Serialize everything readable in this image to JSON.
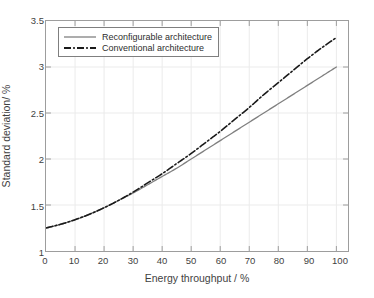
{
  "chart_data": {
    "type": "line",
    "title": "",
    "xlabel": "Energy throughput / %",
    "ylabel": "Standard deviation/ %",
    "xlim": [
      0,
      104
    ],
    "ylim": [
      1,
      3.5
    ],
    "xticks": [
      "0",
      "10",
      "20",
      "30",
      "40",
      "50",
      "60",
      "70",
      "80",
      "90",
      "100"
    ],
    "yticks": [
      "1",
      "1.5",
      "2",
      "2.5",
      "3",
      "3.5"
    ],
    "grid": true,
    "legend_position": "upper left",
    "x": [
      0,
      5,
      10,
      15,
      20,
      25,
      30,
      35,
      40,
      45,
      50,
      55,
      60,
      65,
      70,
      75,
      80,
      85,
      90,
      95,
      100
    ],
    "series": [
      {
        "name": "Reconfigurable architecture",
        "style": "solid",
        "color": "#808080",
        "values": [
          1.25,
          1.29,
          1.34,
          1.4,
          1.47,
          1.55,
          1.63,
          1.72,
          1.81,
          1.9,
          2.0,
          2.1,
          2.2,
          2.3,
          2.4,
          2.5,
          2.6,
          2.7,
          2.8,
          2.9,
          3.0
        ]
      },
      {
        "name": "Conventional architecture",
        "style": "dash-dot",
        "color": "#1a1a1a",
        "values": [
          1.25,
          1.29,
          1.34,
          1.4,
          1.47,
          1.55,
          1.64,
          1.74,
          1.84,
          1.95,
          2.06,
          2.18,
          2.3,
          2.43,
          2.56,
          2.7,
          2.83,
          2.96,
          3.09,
          3.21,
          3.32
        ]
      }
    ]
  },
  "legend": {
    "items": [
      {
        "label": "Reconfigurable architecture",
        "swatch": "solid-gray-line-icon"
      },
      {
        "label": "Conventional architecture",
        "swatch": "dash-dot-black-line-icon"
      }
    ]
  },
  "colors": {
    "reconfigurable": "#808080",
    "conventional": "#1a1a1a",
    "grid": "#eaeaea",
    "axis": "#9d9d9d",
    "background": "#ffffff"
  }
}
